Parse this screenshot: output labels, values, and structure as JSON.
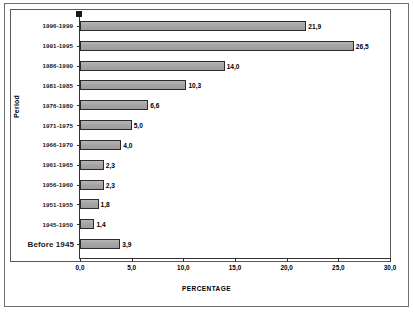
{
  "chart_data": {
    "type": "bar",
    "orientation": "horizontal",
    "title": "",
    "xlabel": "PERCENTAGE",
    "ylabel": "Period",
    "xlim": [
      0,
      30
    ],
    "grid": false,
    "legend": "none",
    "xticks": [
      "0,0",
      "5,0",
      "10,0",
      "15,0",
      "20,0",
      "25,0",
      "30,0"
    ],
    "xtick_values": [
      0,
      5,
      10,
      15,
      20,
      25,
      30
    ],
    "categories": [
      "1996-1999",
      "1991-1995",
      "1986-1990",
      "1981-1985",
      "1976-1980",
      "1971-1975",
      "1966-1970",
      "1961-1965",
      "1956-1960",
      "1951-1955",
      "1945-1950",
      "Before 1945"
    ],
    "values": [
      21.9,
      26.5,
      14.0,
      10.3,
      6.6,
      5.0,
      4.0,
      2.3,
      2.3,
      1.8,
      1.4,
      3.9
    ],
    "value_labels": [
      "21,9",
      "26,5",
      "14,0",
      "10,3",
      "6,6",
      "5,0",
      "4,0",
      "2,3",
      "2,3",
      "1,8",
      "1,4",
      "3,9"
    ],
    "colors": {
      "bar_fill": "#a9a9a9",
      "bar_stroke": "#2b2b2b",
      "axis": "#333333",
      "text": "#000000",
      "background": "#ffffff",
      "frame": "#5a5a5a"
    }
  }
}
